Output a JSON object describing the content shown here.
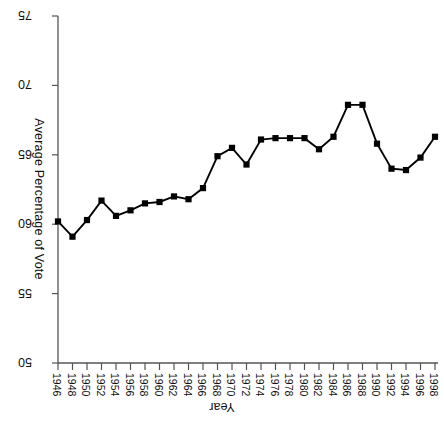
{
  "chart_data": {
    "type": "line",
    "title": "",
    "xlabel": "Year",
    "ylabel": "Average Percentage of Vote",
    "ylim": [
      50,
      75
    ],
    "yticks": [
      50,
      55,
      60,
      65,
      70,
      75
    ],
    "grid": false,
    "legend": "none",
    "marker": "filled-square",
    "orientation_note": "figure rendered rotated 180 degrees",
    "categories": [
      "1946",
      "1948",
      "1950",
      "1952",
      "1954",
      "1956",
      "1958",
      "1960",
      "1962",
      "1964",
      "1966",
      "1968",
      "1970",
      "1972",
      "1974",
      "1976",
      "1978",
      "1980",
      "1982",
      "1984",
      "1986",
      "1988",
      "1990",
      "1992",
      "1994",
      "1996",
      "1998"
    ],
    "x": [
      1946,
      1948,
      1950,
      1952,
      1954,
      1956,
      1958,
      1960,
      1962,
      1964,
      1966,
      1968,
      1970,
      1972,
      1974,
      1976,
      1978,
      1980,
      1982,
      1984,
      1986,
      1988,
      1990,
      1992,
      1994,
      1996,
      1998
    ],
    "values": [
      60.2,
      59.1,
      60.3,
      61.7,
      60.6,
      61.0,
      61.5,
      61.6,
      62.0,
      61.8,
      62.6,
      64.9,
      65.5,
      64.3,
      66.1,
      66.2,
      66.2,
      66.2,
      65.4,
      66.3,
      68.6,
      68.6,
      65.8,
      64.0,
      63.9,
      64.8,
      66.3
    ],
    "series": [
      {
        "name": "Average Percentage of Vote",
        "color": "#000000",
        "values": [
          60.2,
          59.1,
          60.3,
          61.7,
          60.6,
          61.0,
          61.5,
          61.6,
          62.0,
          61.8,
          62.6,
          64.9,
          65.5,
          64.3,
          66.1,
          66.2,
          66.2,
          66.2,
          65.4,
          66.3,
          68.6,
          68.6,
          65.8,
          64.0,
          63.9,
          64.8,
          66.3
        ]
      }
    ]
  },
  "axes": {
    "y_tick_labels": [
      "75",
      "70",
      "65",
      "60",
      "55",
      "50"
    ],
    "x_tick_labels": [
      "1946",
      "1948",
      "1950",
      "1952",
      "1954",
      "1956",
      "1958",
      "1960",
      "1962",
      "1964",
      "1966",
      "1968",
      "1970",
      "1972",
      "1974",
      "1976",
      "1978",
      "1980",
      "1982",
      "1984",
      "1986",
      "1988",
      "1990",
      "1992",
      "1994",
      "1996",
      "1998"
    ],
    "x_axis_title": "Year",
    "y_axis_title": "Average Percentage of Vote"
  },
  "style": {
    "line_color": "#000000",
    "axis_color": "#555555",
    "background": "#ffffff"
  }
}
